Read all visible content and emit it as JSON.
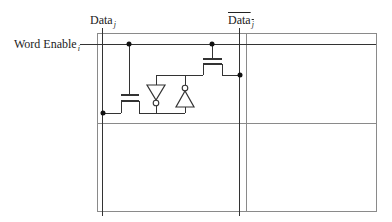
{
  "labels": {
    "data": {
      "text": "Data",
      "sub": "j",
      "x": 90,
      "y": 14
    },
    "data_bar": {
      "text": "Data",
      "sub": "j",
      "x": 228,
      "y": 14,
      "overbar": true
    },
    "word_enable": {
      "text": "Word Enable",
      "sub": "i",
      "x": 14,
      "y": 38
    }
  },
  "colors": {
    "cell_border": "#8a8a8a",
    "wire": "#333333",
    "dot": "#111111"
  },
  "cells": {
    "outer": {
      "x1": 97,
      "y1": 33,
      "x2": 376,
      "y2": 211
    },
    "vertical_divider_x": 246,
    "horizontal_divider_y": 123
  },
  "wires": {
    "data_line": {
      "x": 102,
      "y1": 28,
      "y2": 216
    },
    "data_bar_line": {
      "x": 239,
      "y1": 28,
      "y2": 216
    },
    "word_enable_line": {
      "x1": 80,
      "x2": 376,
      "y": 44
    }
  },
  "transistors": [
    {
      "name": "access-transistor-left",
      "gate_x": 129,
      "gate_top": 44,
      "gate_plate_y": 95,
      "channel_y": 101,
      "x1": 121,
      "x2": 139,
      "leg_bottom": 113
    },
    {
      "name": "access-transistor-right",
      "gate_x": 212,
      "gate_top": 44,
      "gate_plate_y": 59,
      "channel_y": 64,
      "x1": 203,
      "x2": 222,
      "leg_bottom": 75
    }
  ],
  "inverters": [
    {
      "name": "inverter-down",
      "cx": 156,
      "top": 85,
      "apex": 100,
      "half_width": 9,
      "bubble_cy": 103,
      "direction": "down"
    },
    {
      "name": "inverter-up",
      "cx": 185,
      "top": 91,
      "base": 107,
      "half_width": 9,
      "bubble_cy": 88,
      "direction": "up"
    }
  ],
  "nodes": {
    "top_line_y": 75,
    "bottom_line_y": 113,
    "dots": [
      {
        "x": 129,
        "y": 44
      },
      {
        "x": 212,
        "y": 44
      },
      {
        "x": 103,
        "y": 113
      },
      {
        "x": 240,
        "y": 75
      }
    ]
  }
}
